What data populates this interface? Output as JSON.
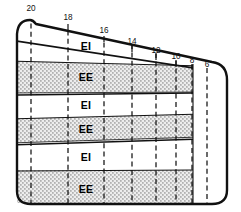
{
  "figure": {
    "colors": {
      "outline": "#111111",
      "band_line": "#111111",
      "dashed_line": "#111111",
      "stipple_fill": "#d9d9d9",
      "plain_fill": "#ffffff",
      "background": "#ffffff",
      "label_text": "#111111"
    }
  },
  "contours": [
    {
      "label": "20",
      "x": 31,
      "label_x": 31,
      "label_y": 9
    },
    {
      "label": "18",
      "x": 68,
      "label_x": 68,
      "label_y": 18
    },
    {
      "label": "16",
      "x": 104,
      "label_x": 104,
      "label_y": 31
    },
    {
      "label": "14",
      "x": 132,
      "label_x": 132,
      "label_y": 42
    },
    {
      "label": "12",
      "x": 156,
      "label_x": 156,
      "label_y": 51
    },
    {
      "label": "10",
      "x": 176,
      "label_x": 176,
      "label_y": 57
    },
    {
      "label": "8",
      "x": 192,
      "label_x": 192,
      "label_y": 61
    },
    {
      "label": "6",
      "x": 207,
      "label_x": 207,
      "label_y": 65
    }
  ],
  "bands": [
    {
      "index": 0,
      "label": "EI",
      "fill": "plain",
      "label_x": 86,
      "label_y": 47
    },
    {
      "index": 1,
      "label": "EE",
      "fill": "stipple",
      "label_x": 86,
      "label_y": 78
    },
    {
      "index": 2,
      "label": "EI",
      "fill": "plain",
      "label_x": 86,
      "label_y": 106
    },
    {
      "index": 3,
      "label": "EE",
      "fill": "stipple",
      "label_x": 86,
      "label_y": 130
    },
    {
      "index": 4,
      "label": "EI",
      "fill": "plain",
      "label_x": 86,
      "label_y": 158
    },
    {
      "index": 5,
      "label": "EE",
      "fill": "stipple",
      "label_x": 86,
      "label_y": 190
    }
  ]
}
